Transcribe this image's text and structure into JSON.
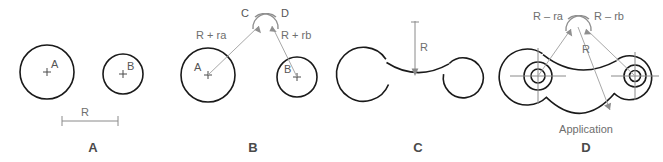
{
  "figure": {
    "background_color": "#ffffff",
    "object_line_color": "#1a1a1a",
    "construction_line_color": "#a8a8a8",
    "label_color": "#6e6e6e",
    "caption_color": "#4a4a4a"
  },
  "panels": [
    {
      "caption": "A",
      "description": "Given two circles A and B and radius R",
      "circle_labels": [
        "A",
        "B"
      ],
      "center_mark": "+",
      "dimension_label": "R"
    },
    {
      "caption": "B",
      "description": "Swing arcs R plus ra and R plus rb to locate intersection points C and D",
      "circle_labels": [
        "A",
        "B"
      ],
      "center_mark": "+",
      "arc_labels": [
        "R + ra",
        "R + rb"
      ],
      "intersection_labels": [
        "C",
        "D"
      ]
    },
    {
      "caption": "C",
      "description": "Draw the tangent arc of radius R",
      "radius_label": "R"
    },
    {
      "caption": "D",
      "description": "Application",
      "arc_labels": [
        "R – ra",
        "R – rb"
      ],
      "radius_label": "R",
      "application_label": "Application"
    }
  ]
}
